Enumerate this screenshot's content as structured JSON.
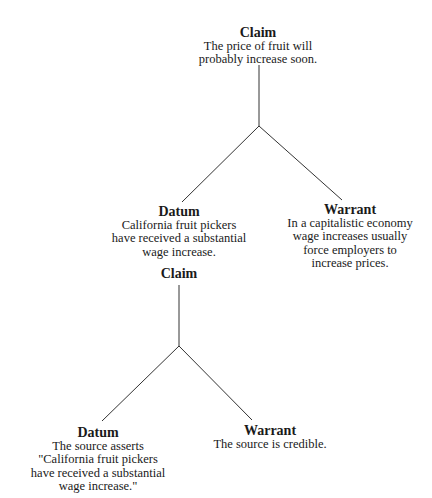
{
  "diagrams": [
    {
      "claim": {
        "heading": "Claim",
        "lines": [
          "The price of fruit will",
          "probably increase soon."
        ]
      },
      "datum": {
        "heading": "Datum",
        "lines": [
          "California fruit pickers",
          "have received a substantial",
          "wage increase."
        ]
      },
      "warrant": {
        "heading": "Warrant",
        "lines": [
          "In a capitalistic economy",
          "wage increases usually",
          "force employers to",
          "increase prices."
        ]
      }
    },
    {
      "claim": {
        "heading": "Claim",
        "lines": []
      },
      "datum": {
        "heading": "Datum",
        "lines": [
          "The source asserts",
          "\"California fruit pickers",
          "have received a substantial",
          "wage increase.\""
        ]
      },
      "warrant": {
        "heading": "Warrant",
        "lines": [
          "The source is credible."
        ]
      }
    }
  ],
  "colors": {
    "line": "#333333",
    "text": "#1a1a1a",
    "background": "#ffffff"
  }
}
